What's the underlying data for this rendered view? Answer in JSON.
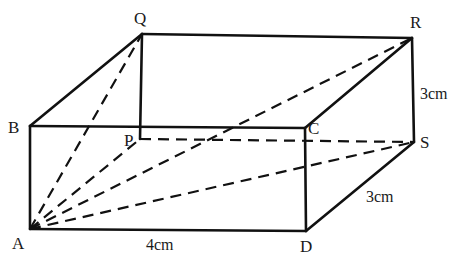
{
  "figure": {
    "type": "cuboid",
    "vertices": {
      "A": {
        "label": "A",
        "x": 30,
        "y": 229
      },
      "B": {
        "label": "B",
        "x": 30,
        "y": 126
      },
      "C": {
        "label": "C",
        "x": 305,
        "y": 128
      },
      "D": {
        "label": "D",
        "x": 306,
        "y": 231
      },
      "P": {
        "label": "P",
        "x": 140,
        "y": 139
      },
      "Q": {
        "label": "Q",
        "x": 142,
        "y": 34
      },
      "R": {
        "label": "R",
        "x": 412,
        "y": 38
      },
      "S": {
        "label": "S",
        "x": 414,
        "y": 142
      }
    },
    "measurements": {
      "AD": "4cm",
      "RS": "3cm",
      "DS": "3cm"
    },
    "solid_edges": [
      "AB",
      "AD",
      "BC",
      "CD",
      "BQ",
      "CR",
      "DS",
      "QR",
      "RS",
      "QP"
    ],
    "dashed_edges": [
      "PS",
      "AP",
      "AQ",
      "AR",
      "AS"
    ]
  }
}
